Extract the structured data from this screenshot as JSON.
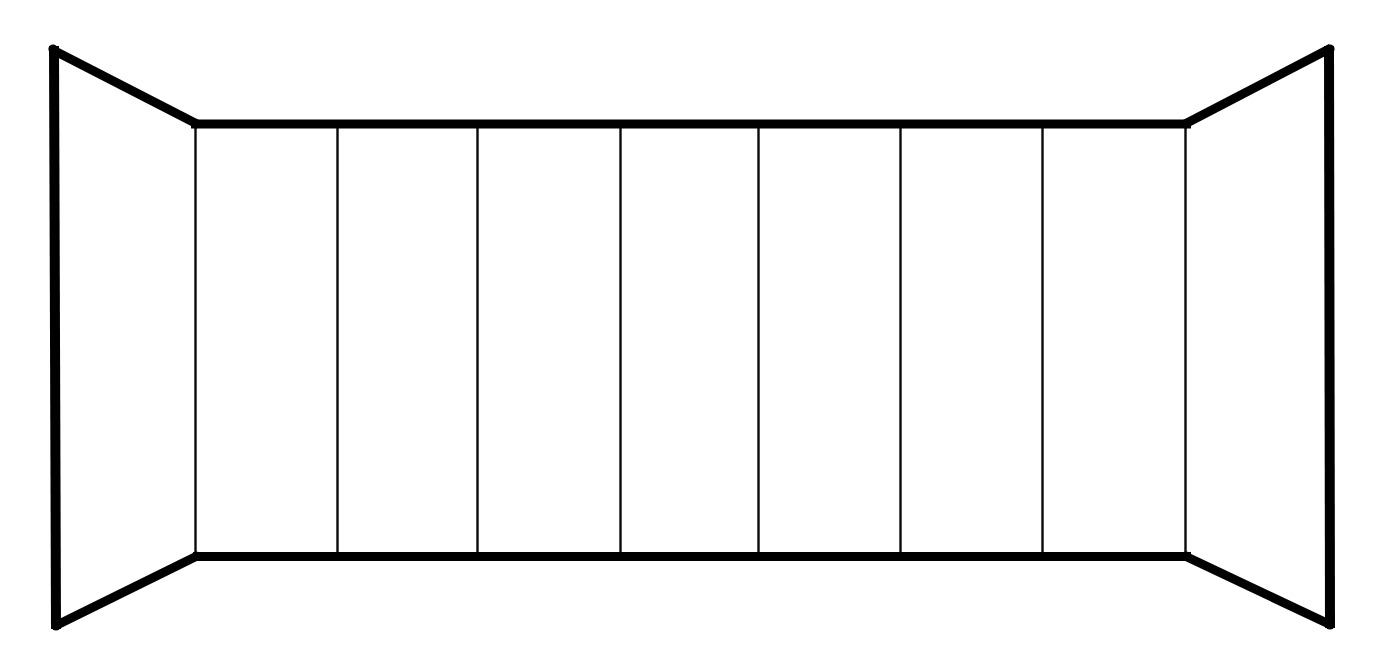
{
  "canvas": {
    "width": 1398,
    "height": 666,
    "background_color": "#ffffff",
    "title": "One-point perspective corridor outline"
  },
  "style": {
    "stroke_color": "#000000",
    "thin_stroke_color": "#0a0a0a",
    "thick_stroke_width": 10,
    "horizontal_stroke_width": 9,
    "diagonal_stroke_width": 9,
    "thin_stroke_width": 2.4,
    "fill_color": "#ffffff"
  },
  "chart_data": {
    "type": "diagram",
    "outer_frame": {
      "top_left": [
        50,
        48
      ],
      "top_right": [
        1332,
        48
      ],
      "bottom_right": [
        1332,
        626
      ],
      "bottom_left": [
        55,
        627
      ]
    },
    "inner_frame": {
      "top_left": [
        195,
        124
      ],
      "top_right": [
        1187,
        124
      ],
      "bottom_right": [
        1187,
        556
      ],
      "bottom_left": [
        196,
        556
      ]
    },
    "edges": [
      {
        "name": "left-outer-vertical",
        "from": [
          53,
          48
        ],
        "to": [
          55,
          627
        ],
        "weight": "thick"
      },
      {
        "name": "right-outer-vertical",
        "from": [
          1330,
          48
        ],
        "to": [
          1331,
          626
        ],
        "weight": "thick"
      },
      {
        "name": "top-back-horizontal",
        "from": [
          192,
          124
        ],
        "to": [
          1190,
          124
        ],
        "weight": "thick"
      },
      {
        "name": "bottom-back-horizontal",
        "from": [
          194,
          556
        ],
        "to": [
          1190,
          556
        ],
        "weight": "thick"
      },
      {
        "name": "top-left-diagonal",
        "from": [
          50,
          48
        ],
        "to": [
          196,
          124
        ],
        "weight": "thick"
      },
      {
        "name": "top-right-diagonal",
        "from": [
          1332,
          48
        ],
        "to": [
          1186,
          124
        ],
        "weight": "thick"
      },
      {
        "name": "bottom-left-diagonal",
        "from": [
          55,
          627
        ],
        "to": [
          196,
          556
        ],
        "weight": "thick"
      },
      {
        "name": "bottom-right-diagonal",
        "from": [
          1332,
          626
        ],
        "to": [
          1186,
          556
        ],
        "weight": "thick"
      }
    ],
    "panel_divider_x": [
      195,
      337,
      477,
      620,
      758,
      900,
      1042,
      1185
    ],
    "panel_divider_y_range": [
      124,
      556
    ],
    "panel_count": 7,
    "panels": [
      {
        "index": 1,
        "x_start": 195,
        "x_end": 337,
        "width": 142
      },
      {
        "index": 2,
        "x_start": 337,
        "x_end": 477,
        "width": 140
      },
      {
        "index": 3,
        "x_start": 477,
        "x_end": 620,
        "width": 143
      },
      {
        "index": 4,
        "x_start": 620,
        "x_end": 758,
        "width": 138
      },
      {
        "index": 5,
        "x_start": 758,
        "x_end": 900,
        "width": 142
      },
      {
        "index": 6,
        "x_start": 900,
        "x_end": 1042,
        "width": 142
      },
      {
        "index": 7,
        "x_start": 1042,
        "x_end": 1185,
        "width": 143
      }
    ],
    "side_walls": [
      {
        "name": "left-side-wall",
        "shape": "trapezoid",
        "points": "50,48 196,124 196,556 55,627"
      },
      {
        "name": "right-side-wall",
        "shape": "trapezoid",
        "points": "1332,48 1186,124 1186,556 1332,626"
      }
    ],
    "grid": false,
    "legend": null,
    "annotations": []
  }
}
